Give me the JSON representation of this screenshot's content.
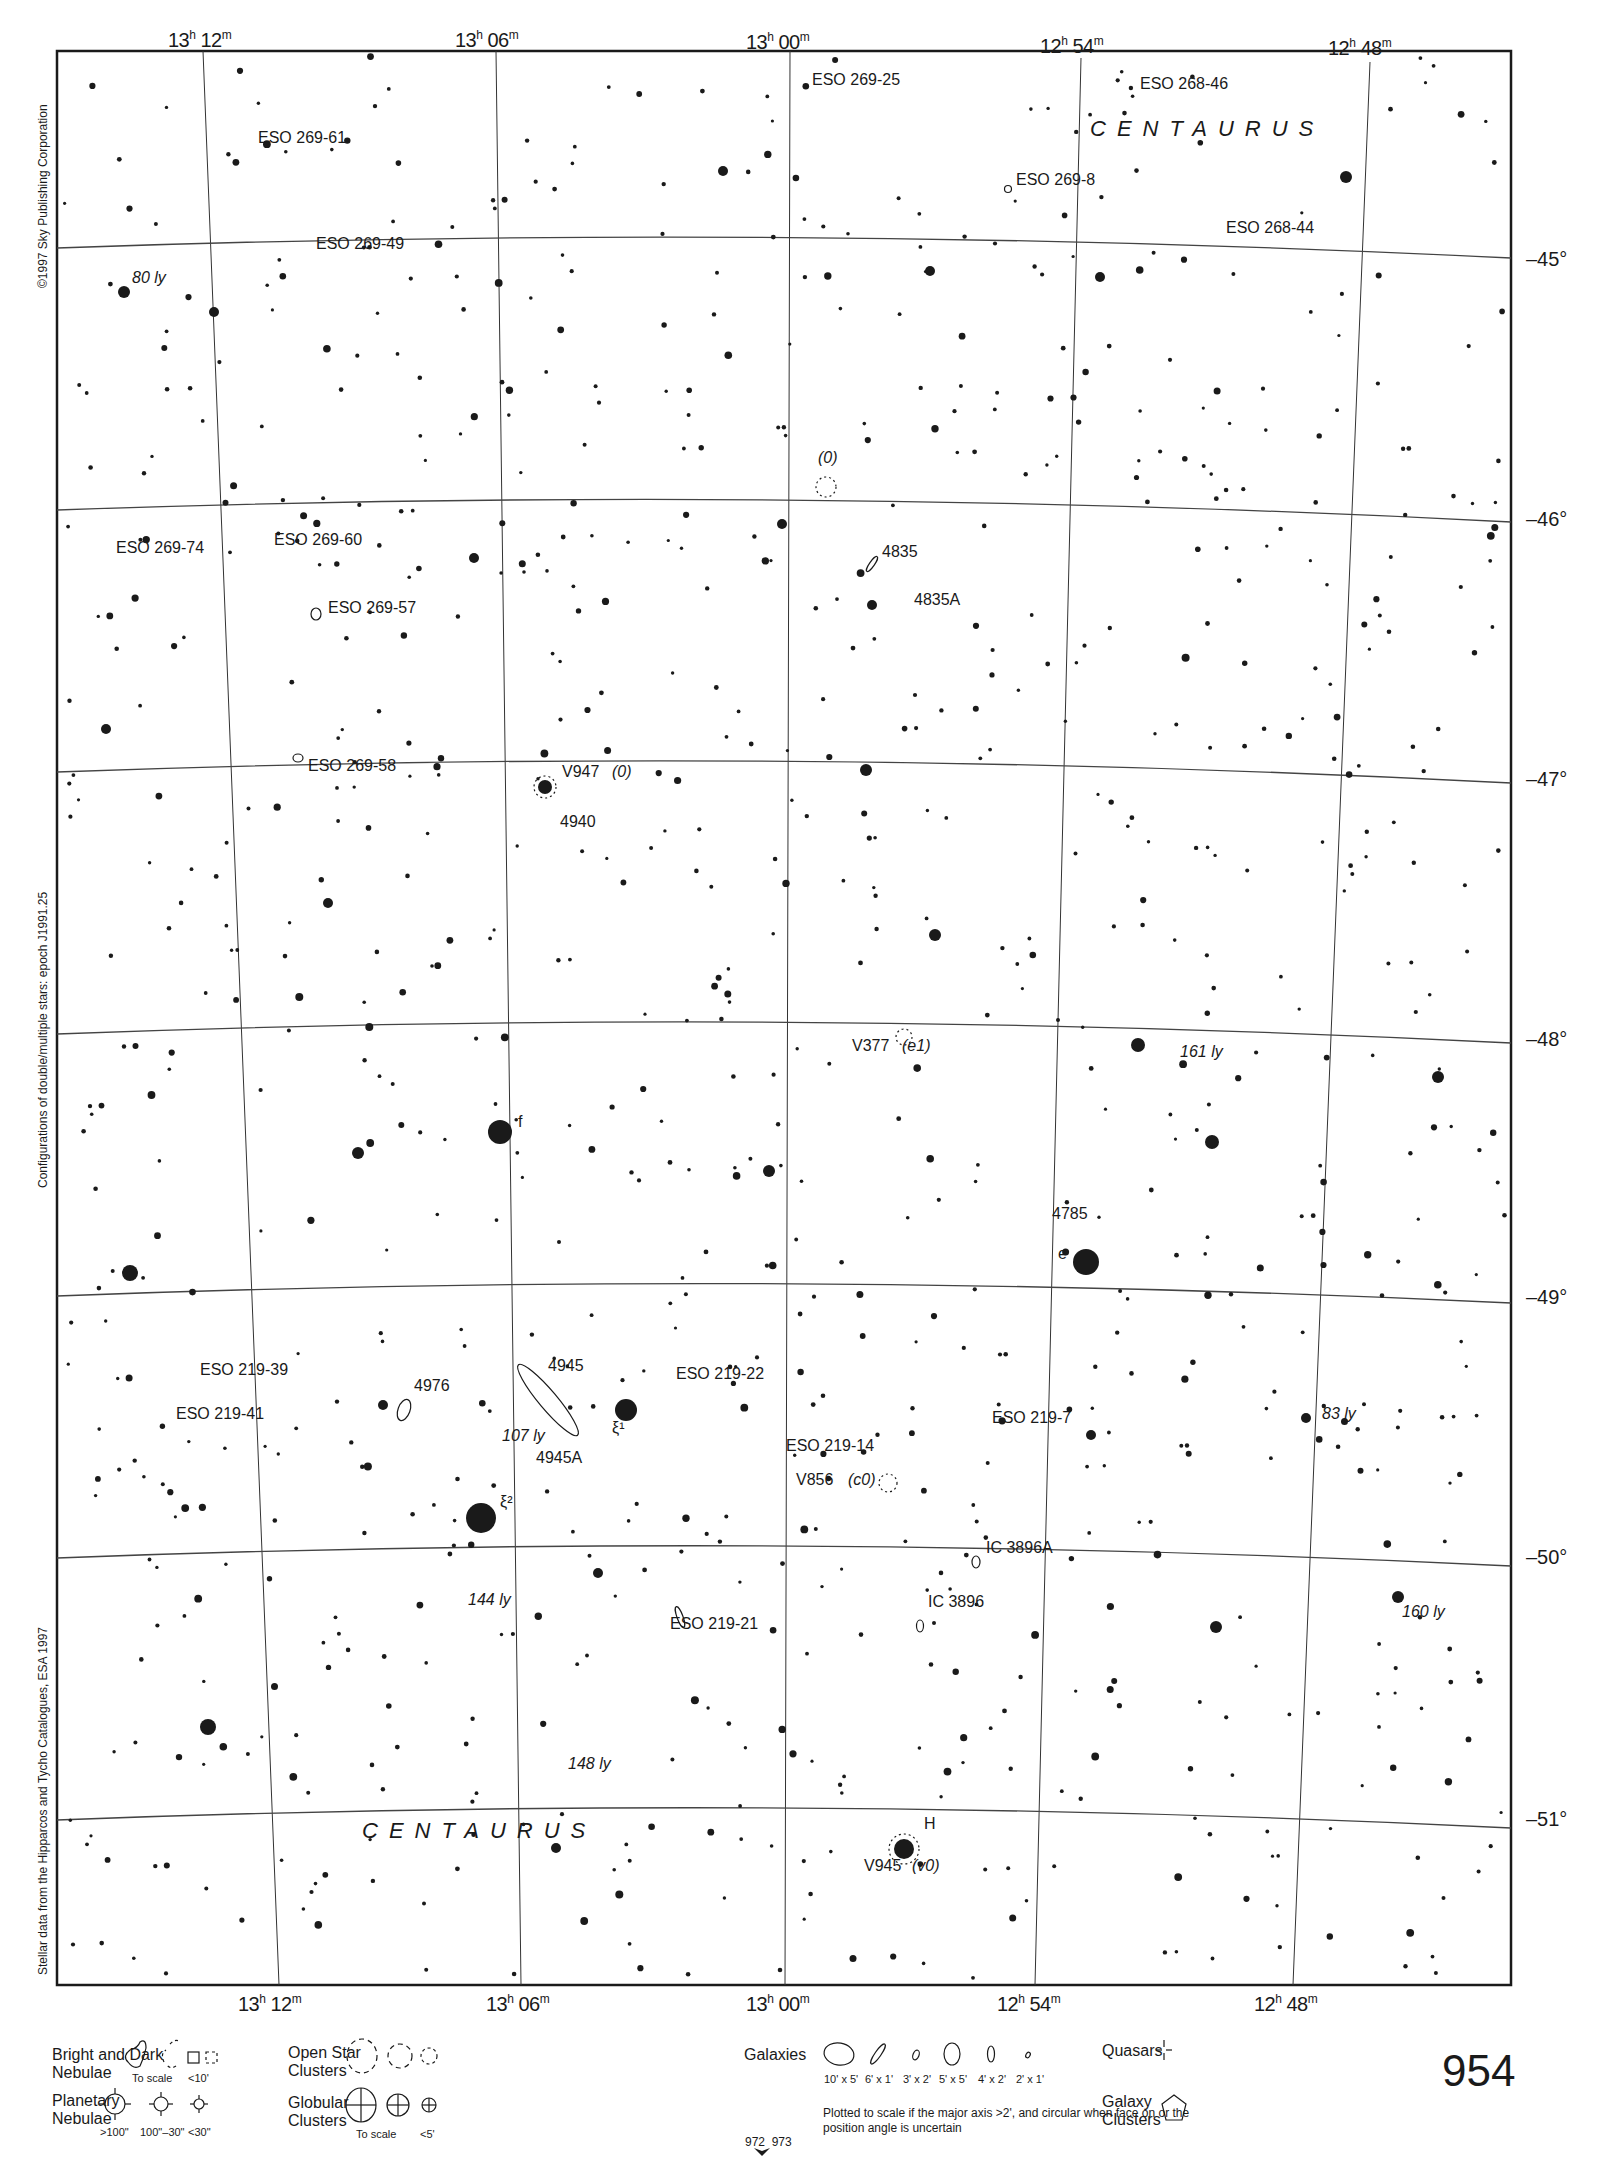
{
  "chart": {
    "page_number": "954",
    "constellation_labels": [
      "CENTAURUS",
      "CENTAURUS"
    ],
    "ra_labels_top": [
      {
        "h": "13",
        "m": "12"
      },
      {
        "h": "13",
        "m": "06"
      },
      {
        "h": "13",
        "m": "00"
      },
      {
        "h": "12",
        "m": "54"
      },
      {
        "h": "12",
        "m": "48"
      }
    ],
    "ra_labels_bottom": [
      {
        "h": "13",
        "m": "12"
      },
      {
        "h": "13",
        "m": "06"
      },
      {
        "h": "13",
        "m": "00"
      },
      {
        "h": "12",
        "m": "54"
      },
      {
        "h": "12",
        "m": "48"
      }
    ],
    "dec_labels": [
      "–45°",
      "–46°",
      "–47°",
      "–48°",
      "–49°",
      "–50°",
      "–51°"
    ],
    "side_texts": {
      "copyright": "©1997 Sky Publishing Corporation",
      "configurations": "Configurations of double/multiple stars: epoch J1991.25",
      "stellar_data": "Stellar data from the Hipparcos and Tycho Catalogues, ESA 1997"
    },
    "objects": [
      {
        "label": "ESO 269-25",
        "x": 812,
        "y": 80
      },
      {
        "label": "ESO 268-46",
        "x": 1140,
        "y": 84
      },
      {
        "label": "ESO 269-61",
        "x": 258,
        "y": 138
      },
      {
        "label": "ESO 269-8",
        "x": 1016,
        "y": 180
      },
      {
        "label": "ESO 269-49",
        "x": 316,
        "y": 244
      },
      {
        "label": "ESO 268-44",
        "x": 1226,
        "y": 228
      },
      {
        "label": "80 ly",
        "x": 132,
        "y": 278,
        "italic": true
      },
      {
        "label": "(0)",
        "x": 818,
        "y": 458,
        "italic": true
      },
      {
        "label": "ESO 269-74",
        "x": 116,
        "y": 548
      },
      {
        "label": "ESO 269-60",
        "x": 274,
        "y": 540
      },
      {
        "label": "4835",
        "x": 882,
        "y": 552
      },
      {
        "label": "ESO 269-57",
        "x": 328,
        "y": 608
      },
      {
        "label": "4835A",
        "x": 914,
        "y": 600
      },
      {
        "label": "ESO 269-58",
        "x": 308,
        "y": 766
      },
      {
        "label": "V947",
        "x": 562,
        "y": 772
      },
      {
        "label": "(0)",
        "x": 612,
        "y": 772,
        "italic": true
      },
      {
        "label": "4940",
        "x": 560,
        "y": 822
      },
      {
        "label": "V377",
        "x": 852,
        "y": 1046
      },
      {
        "label": "(e1)",
        "x": 902,
        "y": 1046,
        "italic": true
      },
      {
        "label": "161 ly",
        "x": 1180,
        "y": 1052,
        "italic": true
      },
      {
        "label": "f",
        "x": 518,
        "y": 1122
      },
      {
        "label": "4785",
        "x": 1052,
        "y": 1214
      },
      {
        "label": "e",
        "x": 1058,
        "y": 1254
      },
      {
        "label": "ESO 219-39",
        "x": 200,
        "y": 1370
      },
      {
        "label": "4945",
        "x": 548,
        "y": 1366
      },
      {
        "label": "ESO 219-22",
        "x": 676,
        "y": 1374
      },
      {
        "label": "4976",
        "x": 414,
        "y": 1386
      },
      {
        "label": "ESO 219-41",
        "x": 176,
        "y": 1414
      },
      {
        "label": "ESO 219-7",
        "x": 992,
        "y": 1418
      },
      {
        "label": "83 ly",
        "x": 1322,
        "y": 1414,
        "italic": true
      },
      {
        "label": "107 ly",
        "x": 502,
        "y": 1436,
        "italic": true
      },
      {
        "label": "4945A",
        "x": 536,
        "y": 1458
      },
      {
        "label": "ESO 219-14",
        "x": 786,
        "y": 1446
      },
      {
        "label": "V856",
        "x": 796,
        "y": 1480
      },
      {
        "label": "(c0)",
        "x": 848,
        "y": 1480,
        "italic": true
      },
      {
        "label": "ξ²",
        "x": 500,
        "y": 1502
      },
      {
        "label": "ξ¹",
        "x": 612,
        "y": 1428
      },
      {
        "label": "IC 3896A",
        "x": 986,
        "y": 1548
      },
      {
        "label": "144 ly",
        "x": 468,
        "y": 1600,
        "italic": true
      },
      {
        "label": "IC 3896",
        "x": 928,
        "y": 1602
      },
      {
        "label": "160 ly",
        "x": 1402,
        "y": 1612,
        "italic": true
      },
      {
        "label": "ESO 219-21",
        "x": 670,
        "y": 1624
      },
      {
        "label": "148 ly",
        "x": 568,
        "y": 1764,
        "italic": true
      },
      {
        "label": "H",
        "x": 924,
        "y": 1824
      },
      {
        "label": "V945",
        "x": 864,
        "y": 1866
      },
      {
        "label": "(v0)",
        "x": 912,
        "y": 1866,
        "italic": true
      }
    ],
    "bright_stars": [
      {
        "x": 124,
        "y": 292,
        "r": 6
      },
      {
        "x": 214,
        "y": 312,
        "r": 5
      },
      {
        "x": 723,
        "y": 171,
        "r": 5
      },
      {
        "x": 1346,
        "y": 177,
        "r": 6
      },
      {
        "x": 1100,
        "y": 277,
        "r": 5
      },
      {
        "x": 930,
        "y": 271,
        "r": 5
      },
      {
        "x": 474,
        "y": 558,
        "r": 5
      },
      {
        "x": 782,
        "y": 524,
        "r": 5
      },
      {
        "x": 872,
        "y": 605,
        "r": 5
      },
      {
        "x": 106,
        "y": 729,
        "r": 5
      },
      {
        "x": 545,
        "y": 787,
        "r": 7
      },
      {
        "x": 866,
        "y": 770,
        "r": 6
      },
      {
        "x": 328,
        "y": 903,
        "r": 5
      },
      {
        "x": 935,
        "y": 935,
        "r": 6
      },
      {
        "x": 1138,
        "y": 1045,
        "r": 7
      },
      {
        "x": 1438,
        "y": 1077,
        "r": 6
      },
      {
        "x": 500,
        "y": 1132,
        "r": 12
      },
      {
        "x": 358,
        "y": 1153,
        "r": 6
      },
      {
        "x": 769,
        "y": 1171,
        "r": 6
      },
      {
        "x": 1212,
        "y": 1142,
        "r": 7
      },
      {
        "x": 130,
        "y": 1273,
        "r": 8
      },
      {
        "x": 1086,
        "y": 1262,
        "r": 13
      },
      {
        "x": 626,
        "y": 1410,
        "r": 11
      },
      {
        "x": 383,
        "y": 1405,
        "r": 5
      },
      {
        "x": 481,
        "y": 1518,
        "r": 15
      },
      {
        "x": 1091,
        "y": 1435,
        "r": 5
      },
      {
        "x": 208,
        "y": 1727,
        "r": 8
      },
      {
        "x": 1216,
        "y": 1627,
        "r": 6
      },
      {
        "x": 1398,
        "y": 1597,
        "r": 6
      },
      {
        "x": 904,
        "y": 1849,
        "r": 10
      },
      {
        "x": 556,
        "y": 1848,
        "r": 5
      },
      {
        "x": 598,
        "y": 1573,
        "r": 5
      },
      {
        "x": 1306,
        "y": 1418,
        "r": 5
      }
    ],
    "color_ink": "#1a1a1a"
  },
  "legend": {
    "nebulae_title": "Bright and Dark\nNebulae",
    "nebulae_caps": [
      "To scale",
      "<10'"
    ],
    "planetary_title": "Planetary\nNebulae",
    "planetary_caps": [
      ">100\"",
      "100\"–30\"",
      "<30\""
    ],
    "open_clusters_title": "Open Star\nClusters",
    "globular_title": "Globular\nClusters",
    "globular_caps": [
      "To scale",
      "<5'"
    ],
    "galaxies_title": "Galaxies",
    "galaxy_caps": [
      "10' x 5'",
      "6' x 1'",
      "3' x 2'",
      "5' x 5'",
      "4' x 2'",
      "2' x 1'"
    ],
    "galaxies_note": "Plotted to scale if the major axis >2', and circular when face on or the position angle is uncertain",
    "quasars_title": "Quasars",
    "galaxy_clusters_title": "Galaxy\nClusters",
    "adjacent_pages": "972  973"
  }
}
